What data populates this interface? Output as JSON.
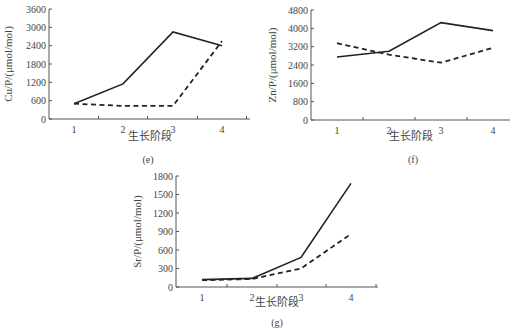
{
  "chart_data": [
    {
      "id": "e",
      "type": "line",
      "title": "",
      "panel_label": "(e)",
      "xlabel": "生长阶段",
      "ylabel": "Cu/P/(μmol/mol)",
      "categories": [
        "1",
        "2",
        "3",
        "4"
      ],
      "yticks": [
        "0",
        "600",
        "1200",
        "1800",
        "2400",
        "3000",
        "3600"
      ],
      "ylim": [
        0,
        3600
      ],
      "grid": false,
      "legend": null,
      "series": [
        {
          "name": "solid",
          "style": "solid",
          "values": [
            500,
            1150,
            2850,
            2400
          ]
        },
        {
          "name": "dashed",
          "style": "dashed",
          "values": [
            500,
            430,
            430,
            2550
          ]
        }
      ]
    },
    {
      "id": "f",
      "type": "line",
      "title": "",
      "panel_label": "(f)",
      "xlabel": "生长阶段",
      "ylabel": "Zn/P/(μmol/mol)",
      "categories": [
        "1",
        "2",
        "3",
        "4"
      ],
      "yticks": [
        "0",
        "800",
        "1600",
        "2400",
        "3200",
        "4000",
        "4800"
      ],
      "ylim": [
        0,
        4800
      ],
      "grid": false,
      "legend": null,
      "series": [
        {
          "name": "solid",
          "style": "solid",
          "values": [
            2750,
            3000,
            4250,
            3900
          ]
        },
        {
          "name": "dashed",
          "style": "dashed",
          "values": [
            3350,
            2850,
            2500,
            3150
          ]
        }
      ]
    },
    {
      "id": "g",
      "type": "line",
      "title": "",
      "panel_label": "(g)",
      "xlabel": "生长阶段",
      "ylabel": "Sr/P/(μmol/mol)",
      "categories": [
        "1",
        "2",
        "3",
        "4"
      ],
      "yticks": [
        "0",
        "300",
        "600",
        "900",
        "1200",
        "1500",
        "1800"
      ],
      "ylim": [
        0,
        1800
      ],
      "grid": false,
      "legend": null,
      "series": [
        {
          "name": "solid",
          "style": "solid",
          "values": [
            120,
            140,
            480,
            1680
          ]
        },
        {
          "name": "dashed",
          "style": "dashed",
          "values": [
            110,
            130,
            300,
            860
          ]
        }
      ]
    }
  ]
}
